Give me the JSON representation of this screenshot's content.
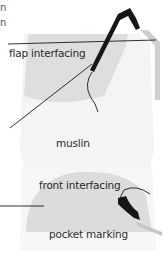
{
  "diagram": {
    "labels": {
      "flap_interfacing": "flap interfacing",
      "muslin": "muslin",
      "front_interfacing": "front interfacing",
      "pocket_marking": "pocket marking"
    },
    "cropped_text_fragments": [
      "n",
      "n"
    ],
    "colors": {
      "muslin_fill": "#f3f3f3",
      "interfacing_fill": "#dcdcdc",
      "edge_gray": "#c8c8c8",
      "stroke": "#1a1a1a",
      "text": "#2a2a2a"
    }
  }
}
